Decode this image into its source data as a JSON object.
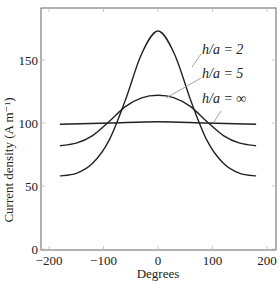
{
  "chart_data": {
    "type": "line",
    "title": "",
    "xlabel": "Degrees",
    "ylabel": "Current density (A m⁻¹)",
    "xlim": [
      -200,
      200
    ],
    "ylim": [
      0,
      190
    ],
    "xticks": [
      -200,
      -100,
      0,
      100,
      200
    ],
    "xtick_labels": [
      "−200",
      "−100",
      "0",
      "100",
      "200"
    ],
    "yticks": [
      0,
      50,
      100,
      150
    ],
    "ytick_labels": [
      "0",
      "50",
      "100",
      "150"
    ],
    "grid": false,
    "legend": "inline annotations with leader lines",
    "series": [
      {
        "name": "h/a = 2",
        "label": "h/a = 2",
        "x": [
          -180,
          -150,
          -120,
          -90,
          -60,
          -30,
          0,
          30,
          60,
          90,
          120,
          150,
          180
        ],
        "values": [
          58,
          60,
          68,
          86,
          118,
          155,
          173,
          155,
          118,
          86,
          68,
          60,
          58
        ]
      },
      {
        "name": "h/a = 5",
        "label": "h/a = 5",
        "x": [
          -180,
          -150,
          -120,
          -90,
          -60,
          -30,
          0,
          30,
          60,
          90,
          120,
          150,
          180
        ],
        "values": [
          82,
          84,
          90,
          101,
          113,
          120,
          122,
          120,
          113,
          101,
          90,
          84,
          82
        ]
      },
      {
        "name": "h/a = ∞",
        "label": "h/a = ∞",
        "x": [
          -180,
          -90,
          0,
          90,
          180
        ],
        "values": [
          99,
          100,
          101,
          100,
          99
        ]
      }
    ],
    "colors": {
      "line": "#222222",
      "leader": "#999999",
      "axis": "#555555"
    }
  }
}
